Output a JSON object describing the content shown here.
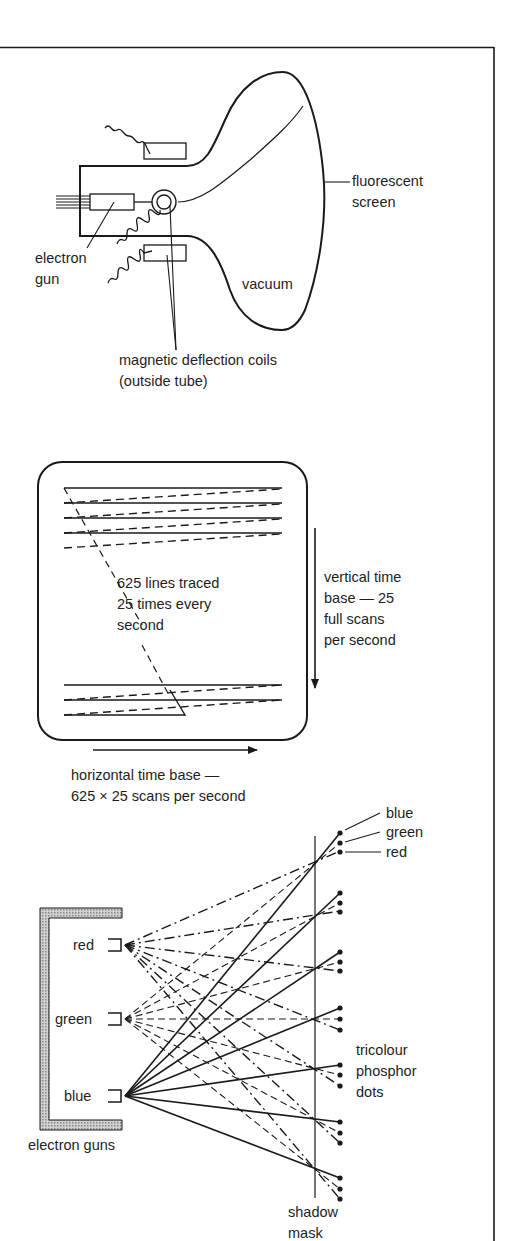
{
  "figure": {
    "panels": [
      {
        "id": "crt-tube",
        "labels": {
          "screen_line1": "fluorescent",
          "screen_line2": "screen",
          "gun_line1": "electron",
          "gun_line2": "gun",
          "vacuum": "vacuum",
          "coils_line1": "magnetic deflection coils",
          "coils_line2": "(outside tube)"
        }
      },
      {
        "id": "raster-scan",
        "labels": {
          "lines_line1": "625 lines traced",
          "lines_line2": "25 times every",
          "lines_line3": "second",
          "vertical_line1": "vertical time",
          "vertical_line2": "base — 25",
          "vertical_line3": "full scans",
          "vertical_line4": "per second",
          "horizontal_line1": "horizontal time base —",
          "horizontal_line2": "625 × 25 scans per second"
        }
      },
      {
        "id": "shadow-mask",
        "labels": {
          "dot_blue": "blue",
          "dot_green": "green",
          "dot_red": "red",
          "gun_red": "red",
          "gun_green": "green",
          "gun_blue": "blue",
          "guns": "electron guns",
          "phosphor_line1": "tricolour",
          "phosphor_line2": "phosphor",
          "phosphor_line3": "dots",
          "mask_line1": "shadow",
          "mask_line2": "mask"
        }
      }
    ],
    "colors": {
      "ink": "#1a1a1a",
      "paper": "#ffffff",
      "bracket_fill": "#b8b8b8"
    }
  }
}
